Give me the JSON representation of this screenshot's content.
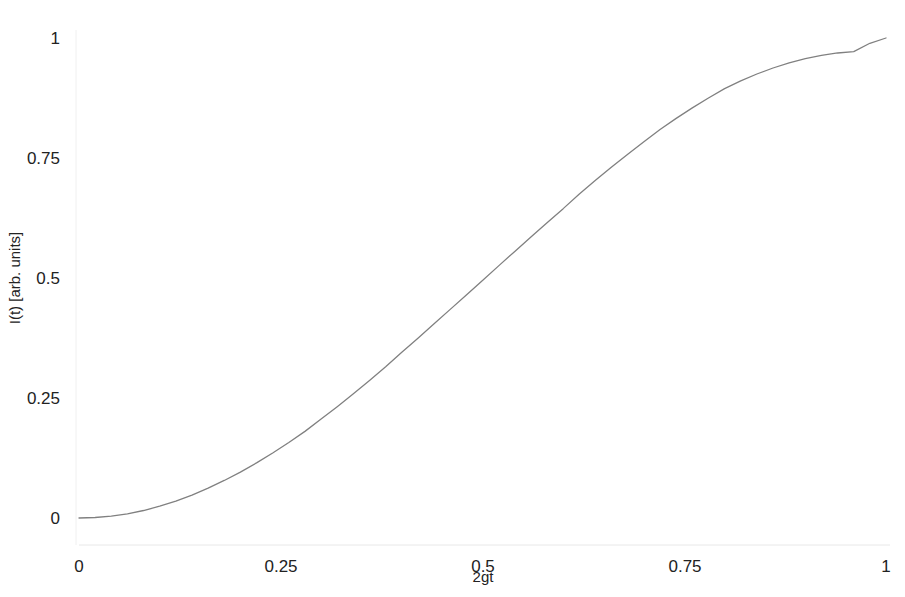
{
  "chart_data": {
    "type": "line",
    "title": "",
    "subtitle": "",
    "xlabel": "2gt",
    "ylabel": "I(t) [arb. units]",
    "xlim": [
      0,
      1
    ],
    "ylim": [
      0,
      1
    ],
    "grid": false,
    "legend": null,
    "legend_position": "none",
    "line_color": "#808080",
    "background_color": "#ffffff",
    "axis_color": "#dddddd",
    "text_color": "#222222",
    "xticks": [
      {
        "value": 0,
        "label": "0"
      },
      {
        "value": 0.25,
        "label": "0.25"
      },
      {
        "value": 0.5,
        "label": "0.5"
      },
      {
        "value": 0.75,
        "label": "0.75"
      },
      {
        "value": 1,
        "label": "1"
      }
    ],
    "yticks": [
      {
        "value": 0,
        "label": "0"
      },
      {
        "value": 0.25,
        "label": "0.25"
      },
      {
        "value": 0.5,
        "label": "0.5"
      },
      {
        "value": 0.75,
        "label": "0.75"
      },
      {
        "value": 1,
        "label": "1"
      }
    ],
    "series": [
      {
        "name": "I(t)",
        "color": "#808080",
        "x": [
          0.0,
          0.02,
          0.04,
          0.06,
          0.08,
          0.1,
          0.12,
          0.14,
          0.16,
          0.18,
          0.2,
          0.22,
          0.24,
          0.26,
          0.28,
          0.3,
          0.32,
          0.34,
          0.36,
          0.38,
          0.4,
          0.42,
          0.44,
          0.46,
          0.48,
          0.5,
          0.52,
          0.54,
          0.56,
          0.58,
          0.6,
          0.62,
          0.64,
          0.66,
          0.68,
          0.7,
          0.72,
          0.74,
          0.76,
          0.78,
          0.8,
          0.82,
          0.84,
          0.86,
          0.88,
          0.9,
          0.92,
          0.94,
          0.96,
          0.98,
          1.0
        ],
        "values": [
          0.0,
          0.001,
          0.0039,
          0.0088,
          0.0156,
          0.0245,
          0.0352,
          0.0477,
          0.0621,
          0.0782,
          0.0955,
          0.1149,
          0.1355,
          0.1574,
          0.1805,
          0.2061,
          0.232,
          0.2588,
          0.2865,
          0.3149,
          0.3455,
          0.3747,
          0.4045,
          0.4346,
          0.4647,
          0.495,
          0.5253,
          0.5554,
          0.5855,
          0.6153,
          0.6445,
          0.6751,
          0.7035,
          0.7312,
          0.758,
          0.7839,
          0.8095,
          0.8326,
          0.8545,
          0.8751,
          0.8945,
          0.9106,
          0.925,
          0.9375,
          0.9482,
          0.9571,
          0.9639,
          0.9688,
          0.9717,
          0.989,
          1.0
        ]
      }
    ]
  },
  "axes": {
    "x_axis_name": "horizontal-axis",
    "y_axis_name": "vertical-axis"
  }
}
